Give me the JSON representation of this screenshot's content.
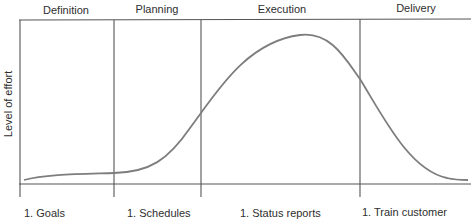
{
  "diagram": {
    "title": "",
    "phases": [
      {
        "label": "Definition"
      },
      {
        "label": "Planning"
      },
      {
        "label": "Execution"
      },
      {
        "label": "Delivery"
      }
    ],
    "y_axis_label": "Level of effort",
    "bottom_items": [
      {
        "label": "1. Goals"
      },
      {
        "label": "1. Schedules"
      },
      {
        "label": "1. Status reports"
      },
      {
        "label": "1. Train customer"
      }
    ],
    "curve": {
      "description": "Level of effort across project life cycle",
      "relative_effort": [
        {
          "phase": "Definition",
          "start": 0.03,
          "end": 0.07
        },
        {
          "phase": "Planning",
          "start": 0.07,
          "end": 0.45
        },
        {
          "phase": "Execution",
          "start": 0.45,
          "peak": 0.96,
          "end": 0.65
        },
        {
          "phase": "Delivery",
          "start": 0.65,
          "end": 0.02
        }
      ]
    },
    "colors": {
      "lines": "#555555",
      "curve": "#7d7d7d",
      "text": "#2e2e2e"
    }
  }
}
